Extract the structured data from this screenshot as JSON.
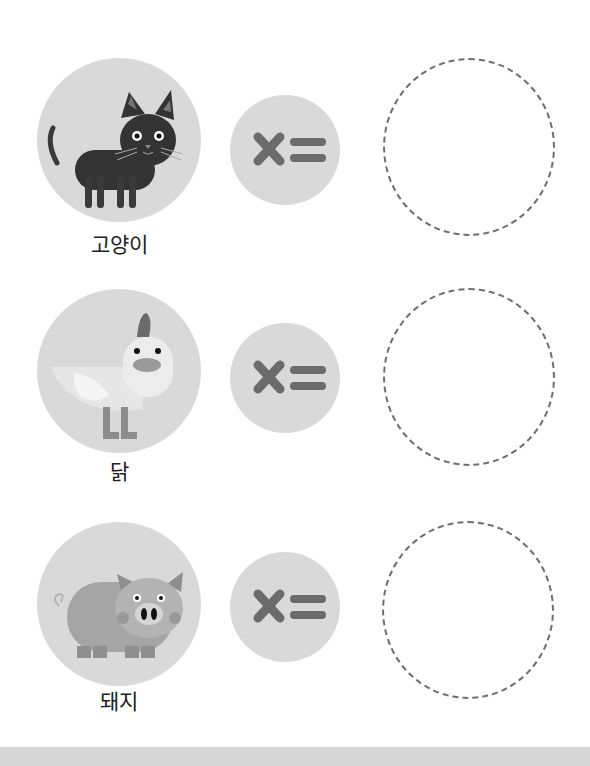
{
  "worksheet": {
    "rows": [
      {
        "animal": "cat",
        "label": "고양이",
        "icon": "cat-icon",
        "operator": "multiply-equals-icon"
      },
      {
        "animal": "chicken",
        "label": "닭",
        "icon": "chicken-icon",
        "operator": "multiply-equals-icon"
      },
      {
        "animal": "pig",
        "label": "돼지",
        "icon": "pig-icon",
        "operator": "multiply-equals-icon"
      }
    ],
    "colors": {
      "circle_fill": "#d9d9d9",
      "operator_glyph": "#6b6b6b",
      "dashed_border": "#6e6e6e",
      "footer_band": "#d7d7d7"
    }
  }
}
